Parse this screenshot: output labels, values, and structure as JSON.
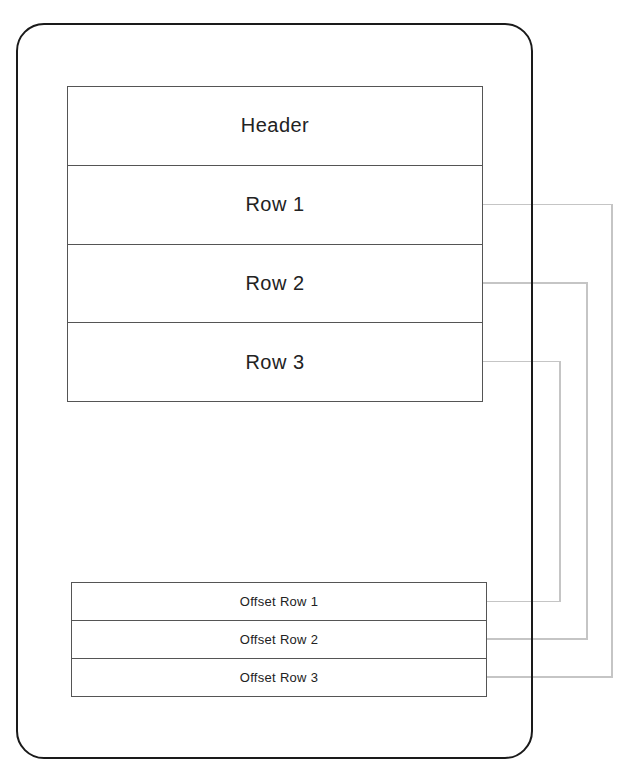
{
  "diagram": {
    "device": {
      "kind": "tablet-outline"
    },
    "table": {
      "header": "Header",
      "rows": [
        {
          "key": "row-1",
          "label": "Row 1"
        },
        {
          "key": "row-2",
          "label": "Row 2"
        },
        {
          "key": "row-3",
          "label": "Row 3"
        }
      ]
    },
    "offset_table": {
      "rows": [
        {
          "key": "offset-row-1",
          "label": "Offset Row 1"
        },
        {
          "key": "offset-row-2",
          "label": "Offset Row 2"
        },
        {
          "key": "offset-row-3",
          "label": "Offset Row 3"
        }
      ]
    },
    "connections": [
      {
        "from": "row-1",
        "to": "offset-row-3"
      },
      {
        "from": "row-2",
        "to": "offset-row-2"
      },
      {
        "from": "row-3",
        "to": "offset-row-1"
      }
    ],
    "colors": {
      "frame": "#1a1a1a",
      "table_border": "#555555",
      "connector": "#c5c5c5",
      "text": "#222222"
    }
  }
}
